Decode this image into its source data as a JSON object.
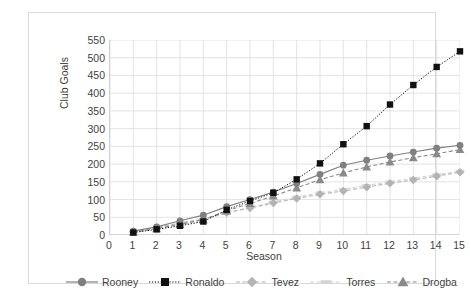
{
  "chart_data": {
    "type": "line",
    "title": "",
    "xlabel": "Season",
    "ylabel": "Club Goals",
    "xlim": [
      0,
      15
    ],
    "ylim": [
      0,
      550
    ],
    "ytick_step": 50,
    "grid": true,
    "legend_position": "bottom",
    "x": [
      1,
      2,
      3,
      4,
      5,
      6,
      7,
      8,
      9,
      10,
      11,
      12,
      13,
      14,
      15
    ],
    "xticks": [
      "0",
      "1",
      "2",
      "3",
      "4",
      "5",
      "6",
      "7",
      "8",
      "9",
      "10",
      "11",
      "12",
      "13",
      "14",
      "15"
    ],
    "yticks": [
      "0",
      "50",
      "100",
      "150",
      "200",
      "250",
      "300",
      "350",
      "400",
      "450",
      "500",
      "550"
    ],
    "series": [
      {
        "name": "Rooney",
        "color": "#808080",
        "marker": "circle",
        "line_style": "solid",
        "values": [
          11,
          23,
          40,
          56,
          80,
          100,
          121,
          145,
          171,
          197,
          211,
          223,
          234,
          245,
          253
        ]
      },
      {
        "name": "Ronaldo",
        "color": "#111111",
        "marker": "square",
        "line_style": "dotted",
        "values": [
          7,
          16,
          26,
          38,
          71,
          96,
          119,
          157,
          202,
          256,
          307,
          368,
          423,
          474,
          518
        ]
      },
      {
        "name": "Tevez",
        "color": "#b3b3b3",
        "marker": "diamond",
        "line_style": "dashed",
        "values": [
          10,
          21,
          34,
          45,
          63,
          76,
          90,
          103,
          115,
          124,
          135,
          146,
          155,
          166,
          177
        ]
      },
      {
        "name": "Torres",
        "color": "#d4d4d4",
        "marker": "dash",
        "line_style": "dashed",
        "values": [
          9,
          19,
          31,
          44,
          62,
          78,
          93,
          107,
          119,
          129,
          140,
          150,
          160,
          170,
          180
        ]
      },
      {
        "name": "Drogba",
        "color": "#8a8a8a",
        "marker": "triangle",
        "line_style": "dashed",
        "values": [
          8,
          18,
          30,
          43,
          68,
          89,
          110,
          133,
          156,
          175,
          192,
          206,
          218,
          229,
          241
        ]
      }
    ]
  },
  "legend": {
    "items": [
      {
        "label": "Rooney"
      },
      {
        "label": "Ronaldo"
      },
      {
        "label": "Tevez"
      },
      {
        "label": "Torres"
      },
      {
        "label": "Drogba"
      }
    ]
  }
}
